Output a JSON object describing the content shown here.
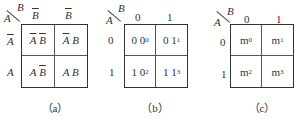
{
  "maps": [
    {
      "id": "a",
      "caption": "（a）",
      "row_var": "A",
      "col_var": "B",
      "col_headers": [
        "B̄",
        "B̄"
      ],
      "row_headers": [
        "Ā",
        "A"
      ],
      "cells": [
        "Ā B̄",
        "Ā B",
        "A B̄",
        "A B"
      ]
    },
    {
      "id": "b",
      "caption": "（b）",
      "row_var": "A",
      "col_var": "B",
      "col_headers": [
        "0",
        "1"
      ],
      "row_headers": [
        "0",
        "1"
      ],
      "cells": [
        {
          "bits": "0 0",
          "sub": "0"
        },
        {
          "bits": "0 1",
          "sub": "1"
        },
        {
          "bits": "1 0",
          "sub": "2"
        },
        {
          "bits": "1 1",
          "sub": "3"
        }
      ]
    },
    {
      "id": "c",
      "caption": "（c）",
      "row_var": "A",
      "col_var": "B",
      "col_headers": [
        "0",
        "1"
      ],
      "row_headers": [
        "0",
        "1"
      ],
      "cells": [
        {
          "m": "m",
          "sub": "0"
        },
        {
          "m": "m",
          "sub": "1"
        },
        {
          "m": "m",
          "sub": "2"
        },
        {
          "m": "m",
          "sub": "3"
        }
      ]
    }
  ]
}
